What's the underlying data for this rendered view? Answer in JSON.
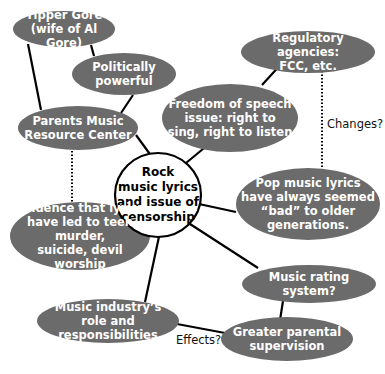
{
  "diagram": {
    "type": "concept-web",
    "fill_color": "#6b6b6b",
    "line_color": "#000000",
    "center": {
      "id": "center",
      "label": "Rock\nmusic lyrics\nand issue of\ncensorship"
    },
    "nodes": [
      {
        "id": "tipper",
        "label": "Tipper Gore\n(wife of Al Gore)"
      },
      {
        "id": "political",
        "label": "Politically powerful"
      },
      {
        "id": "pmrc",
        "label": "Parents Music\nResource Center"
      },
      {
        "id": "regulatory",
        "label": "Regulatory agencies:\nFCC, etc."
      },
      {
        "id": "freedom",
        "label": "Freedom of speech\nissue: right to\nsing, right to listen"
      },
      {
        "id": "evidence",
        "label": "Evidence that lyrics\nhave led to teen murder,\nsuicide, devil worship"
      },
      {
        "id": "pop",
        "label": "Pop music lyrics\nhave always seemed\n“bad” to older\ngenerations."
      },
      {
        "id": "rating",
        "label": "Music rating system?"
      },
      {
        "id": "industry",
        "label": "Music industry’s\nrole and responsibilities"
      },
      {
        "id": "parental",
        "label": "Greater parental\nsupervision"
      }
    ],
    "edge_labels": {
      "changes": "Changes?",
      "effects": "Effects?"
    },
    "edges": [
      {
        "from": "tipper",
        "to": "pmrc",
        "style": "solid"
      },
      {
        "from": "tipper",
        "to": "political",
        "style": "solid"
      },
      {
        "from": "political",
        "to": "pmrc",
        "style": "solid"
      },
      {
        "from": "pmrc",
        "to": "center",
        "style": "solid"
      },
      {
        "from": "pmrc",
        "to": "evidence",
        "style": "dotted"
      },
      {
        "from": "regulatory",
        "to": "freedom",
        "style": "solid"
      },
      {
        "from": "regulatory",
        "to": "pop",
        "style": "dotted",
        "label": "Changes?"
      },
      {
        "from": "freedom",
        "to": "center",
        "style": "solid"
      },
      {
        "from": "center",
        "to": "evidence",
        "style": "solid"
      },
      {
        "from": "center",
        "to": "pop",
        "style": "solid"
      },
      {
        "from": "center",
        "to": "rating",
        "style": "solid"
      },
      {
        "from": "center",
        "to": "industry",
        "style": "solid"
      },
      {
        "from": "rating",
        "to": "parental",
        "style": "solid"
      },
      {
        "from": "industry",
        "to": "parental",
        "style": "solid",
        "label": "Effects?"
      }
    ]
  }
}
